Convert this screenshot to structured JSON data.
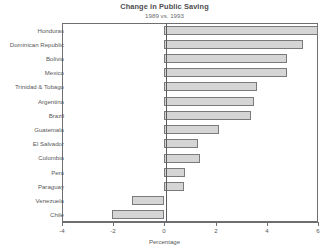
{
  "chart_data": {
    "type": "bar",
    "orientation": "horizontal",
    "title": "Change in Public Saving",
    "subtitle": "1989 vs. 1993",
    "xlabel": "Percentage",
    "ylabel": "",
    "xlim": [
      -4,
      6
    ],
    "xticks": [
      -4,
      -2,
      0,
      2,
      4,
      6
    ],
    "xticklabels": [
      "-4",
      "-2",
      "0",
      "2",
      "4",
      "6"
    ],
    "grid": false,
    "legend": null,
    "categories": [
      "Honduras",
      "Dominican Republic",
      "Bolivia",
      "Mexico",
      "Trinidad & Tobago",
      "Argentina",
      "Brazil",
      "Guatemala",
      "El Salvador",
      "Colombia",
      "Peru",
      "Paraguay",
      "Venezuela",
      "Chile"
    ],
    "values": [
      6.1,
      5.4,
      4.8,
      4.8,
      3.6,
      3.5,
      3.4,
      2.15,
      1.3,
      1.4,
      0.8,
      0.75,
      -1.25,
      -2.05
    ],
    "bar_color": "#d5d5d5",
    "bar_edge_color": "#7a7a7c"
  },
  "axis": {
    "x_title": "Percentage"
  }
}
